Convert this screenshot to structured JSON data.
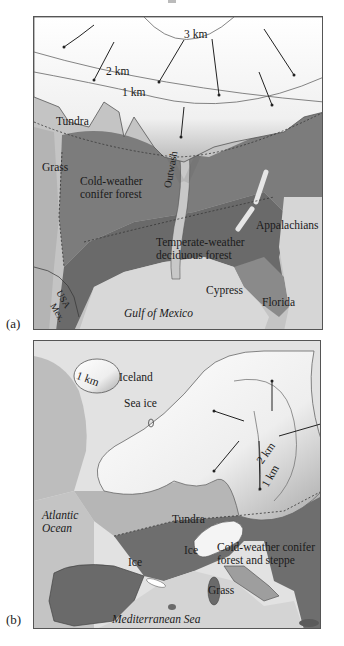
{
  "figure": {
    "panels": [
      {
        "letter": "(a)",
        "region": "North America",
        "labels": {
          "contour_3km": "3 km",
          "contour_2km": "2 km",
          "contour_1km": "1 km",
          "tundra": "Tundra",
          "grass": "Grass",
          "conifer_1": "Cold-weather",
          "conifer_2": "conifer forest",
          "outwash": "Outwash",
          "appalachians": "Appalachians",
          "deciduous_1": "Temperate-weather",
          "deciduous_2": "deciduous forest",
          "cypress": "Cypress",
          "florida": "Florida",
          "usa": "USA",
          "mex": "Mex.",
          "gulf": "Gulf of Mexico"
        }
      },
      {
        "letter": "(b)",
        "region": "Europe",
        "labels": {
          "iceland_contour": "1 km",
          "iceland": "Iceland",
          "sea_ice": "Sea ice",
          "contour_2km": "2 km",
          "contour_1km": "1 km",
          "atlantic_1": "Atlantic",
          "atlantic_2": "Ocean",
          "tundra": "Tundra",
          "ice_alps": "Ice",
          "ice_pyrenees": "Ice",
          "conifer_1": "Cold-weather conifer",
          "conifer_2": "forest and steppe",
          "grass": "Grass",
          "mediterranean": "Mediterranean Sea"
        }
      }
    ],
    "colors": {
      "ice": "#f2f2f2",
      "ice_edge": "#9a9a9a",
      "tundra": "#c4c4c4",
      "sea": "#d4d4d4",
      "forest": "#7a7a7a",
      "deciduous": "#6c6c6c",
      "grass": "#a8a8a8",
      "outline": "#444444"
    }
  }
}
